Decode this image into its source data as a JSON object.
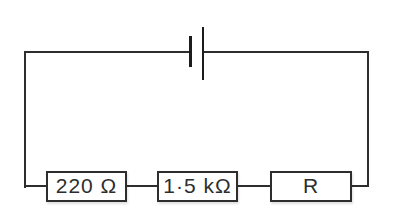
{
  "circuit": {
    "kind": "series-circuit-diagram",
    "battery": {
      "symbol": "single-cell",
      "plates": [
        "short-thick",
        "long-thin"
      ]
    },
    "resistors": [
      {
        "label": "220 Ω"
      },
      {
        "label": "1·5 kΩ"
      },
      {
        "label": "R"
      }
    ],
    "colors": {
      "line": "#2d2d2d",
      "background": "#ffffff",
      "text": "#2d2d2d"
    }
  }
}
